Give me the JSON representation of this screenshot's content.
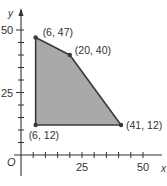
{
  "chart_data": {
    "type": "area",
    "title": "",
    "xlabel": "x",
    "ylabel": "y",
    "origin_label": "O",
    "xlim": [
      0,
      55
    ],
    "ylim": [
      0,
      55
    ],
    "x_ticks_major": [
      25,
      50
    ],
    "y_ticks_major": [
      25,
      50
    ],
    "tick_step": 5,
    "grid": false,
    "polygon": {
      "vertices": [
        {
          "x": 6,
          "y": 47,
          "label": "(6, 47)"
        },
        {
          "x": 20,
          "y": 40,
          "label": "(20, 40)"
        },
        {
          "x": 41,
          "y": 12,
          "label": "(41, 12)"
        },
        {
          "x": 6,
          "y": 12,
          "label": "(6, 12)"
        }
      ],
      "fill": "#a9a9a9",
      "stroke": "#3a3a3a"
    }
  },
  "axes": {
    "x_label": "x",
    "y_label": "y",
    "origin": "O",
    "x_tick_labels": [
      "25",
      "50"
    ],
    "y_tick_labels": [
      "25",
      "50"
    ]
  },
  "colors": {
    "axis": "#333333",
    "fill": "#a9a9a9",
    "stroke": "#3a3a3a"
  }
}
